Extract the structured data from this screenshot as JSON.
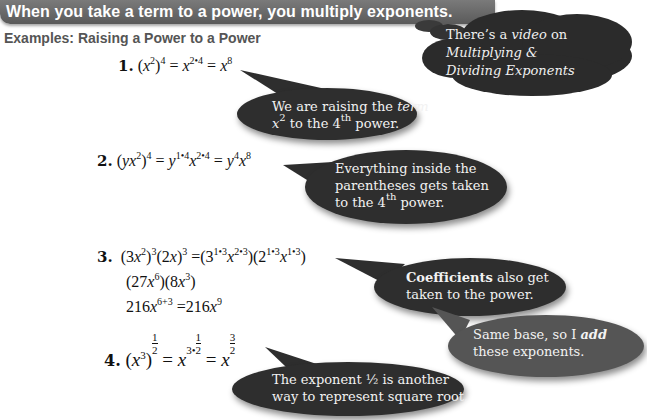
{
  "header": {
    "title": "When you take a term to a power, you multiply exponents.",
    "subtitle": "Examples:  Raising a Power to a Power"
  },
  "video_note": {
    "line1_prefix": "There’s a ",
    "line1_italic": "video",
    "line1_suffix": " on",
    "line2": "Multiplying &",
    "line3": "Dividing Exponents"
  },
  "examples": [
    {
      "number": "1.",
      "expression": "(x^2)^4 = x^(2•4) = x^8",
      "note": {
        "line1_prefix": "We are raising the ",
        "line1_italic": "term",
        "line2_base": "x",
        "line2_sup": "2",
        "line2_mid": " to the 4",
        "line2_sup2": "th",
        "line2_suffix": " power."
      }
    },
    {
      "number": "2.",
      "expression": "(yx^2)^4 = y^(1•4) x^(2•4) = y^4 x^8",
      "note": {
        "line1": "Everything inside the",
        "line2": "parentheses gets taken",
        "line3_prefix": "to the 4",
        "line3_sup": "th",
        "line3_suffix": " power."
      }
    },
    {
      "number": "3.",
      "lines": [
        "(3x^2)^3(2x)^3 = (3^(1•3) x^(2•3))(2^(1•3) x^(1•3))",
        "(27x^6)(8x^3)",
        "216x^(6+3) = 216x^9"
      ],
      "note": {
        "bold": "Coefficients",
        "line1_suffix": " also get",
        "line2": "taken to the power."
      },
      "note2": {
        "line1_prefix": "Same base, so I ",
        "line1_bold_italic": "add",
        "line2": "these exponents."
      }
    },
    {
      "number": "4.",
      "expression": "(x^3)^(1/2) = x^(3•1/2) = x^(3/2)",
      "note": {
        "line1": "The exponent ½ is another",
        "line2": "way to represent square root."
      }
    }
  ],
  "colors": {
    "banner": "#666666",
    "bubble_dark": "#2e2e2e",
    "bubble_mid": "#555555",
    "subtitle": "#555555"
  }
}
